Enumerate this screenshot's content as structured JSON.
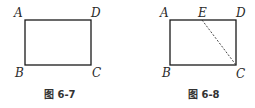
{
  "figures": [
    {
      "caption": "图 6-7",
      "vertices": {
        "A": "A",
        "B": "B",
        "C": "C",
        "D": "D"
      },
      "shape": "rectangle ABCD"
    },
    {
      "caption": "图 6-8",
      "vertices": {
        "A": "A",
        "B": "B",
        "C": "C",
        "D": "D",
        "E": "E"
      },
      "shape": "rectangle ABCD with point E on AD",
      "dashed_segment": "EC"
    }
  ],
  "colors": {
    "stroke": "#1a1a1a",
    "text": "#2a2a2a"
  }
}
